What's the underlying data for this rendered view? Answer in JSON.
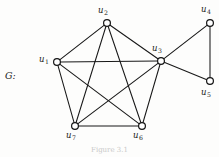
{
  "figure": {
    "graph_name": "G:",
    "caption": "Figure 3.1"
  },
  "colors": {
    "edge": "#181818",
    "vertex_stroke": "#141414",
    "vertex_fill": "#ffffff",
    "background": "#fdfdfc",
    "label": "#1a1a1a"
  },
  "chart_data": {
    "type": "diagram",
    "title": "G:",
    "subtype": "undirected-graph",
    "vertex_count": 7,
    "edge_count": 13,
    "vertices": [
      {
        "id": "u1",
        "base": "u",
        "sub": "1",
        "x": 57,
        "y": 62,
        "label_x": 39,
        "label_y": 55
      },
      {
        "id": "u2",
        "base": "u",
        "sub": "2",
        "x": 107,
        "y": 23,
        "label_x": 98,
        "label_y": 6
      },
      {
        "id": "u3",
        "base": "u",
        "sub": "3",
        "x": 161,
        "y": 61,
        "label_x": 152,
        "label_y": 44
      },
      {
        "id": "u4",
        "base": "u",
        "sub": "4",
        "x": 210,
        "y": 23,
        "label_x": 201,
        "label_y": 5
      },
      {
        "id": "u5",
        "base": "u",
        "sub": "5",
        "x": 210,
        "y": 81,
        "label_x": 201,
        "label_y": 88
      },
      {
        "id": "u6",
        "base": "u",
        "sub": "6",
        "x": 142,
        "y": 126,
        "label_x": 133,
        "label_y": 131
      },
      {
        "id": "u7",
        "base": "u",
        "sub": "7",
        "x": 75,
        "y": 126,
        "label_x": 66,
        "label_y": 131
      }
    ],
    "edges": [
      {
        "from": "u1",
        "to": "u2"
      },
      {
        "from": "u1",
        "to": "u3"
      },
      {
        "from": "u1",
        "to": "u6"
      },
      {
        "from": "u1",
        "to": "u7"
      },
      {
        "from": "u2",
        "to": "u3"
      },
      {
        "from": "u2",
        "to": "u6"
      },
      {
        "from": "u2",
        "to": "u7"
      },
      {
        "from": "u3",
        "to": "u6"
      },
      {
        "from": "u3",
        "to": "u7"
      },
      {
        "from": "u6",
        "to": "u7"
      },
      {
        "from": "u3",
        "to": "u4"
      },
      {
        "from": "u3",
        "to": "u5"
      },
      {
        "from": "u4",
        "to": "u5"
      }
    ]
  }
}
